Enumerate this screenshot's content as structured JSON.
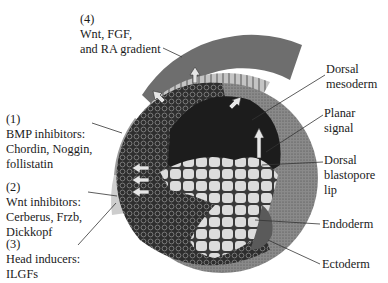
{
  "figure": {
    "left_labels": [
      {
        "id": "wnt_fgf_ra",
        "lines": [
          "(4)",
          "Wnt, FGF,",
          "and RA gradient"
        ]
      },
      {
        "id": "bmp_inhibitors",
        "lines": [
          "(1)",
          "BMP inhibitors:",
          "Chordin, Noggin,",
          "follistatin"
        ]
      },
      {
        "id": "wnt_inhibitors",
        "lines": [
          "(2)",
          "Wnt inhibitors:",
          "Cerberus, Frzb,",
          "Dickkopf"
        ]
      },
      {
        "id": "head_inducers",
        "lines": [
          "(3)",
          "Head inducers:",
          "ILGFs"
        ]
      }
    ],
    "right_labels": [
      {
        "id": "dorsal_mesoderm",
        "lines": [
          "Dorsal",
          "mesoderm"
        ]
      },
      {
        "id": "planar_signal",
        "lines": [
          "Planar",
          "signal"
        ]
      },
      {
        "id": "dorsal_blastopore_lip",
        "lines": [
          "Dorsal",
          "blastopore",
          "lip"
        ]
      },
      {
        "id": "endoderm",
        "lines": [
          "Endoderm"
        ]
      },
      {
        "id": "ectoderm",
        "lines": [
          "Ectoderm"
        ]
      }
    ],
    "colors": {
      "gradient_band": "#6e6e6e",
      "striped_band": "#b8b8b8",
      "bmp_band": "#9a9a9a",
      "wnt_band": "#c8c8c8",
      "embryo_outer": "#3a3a3a",
      "blastocoel": "#1c1c1c",
      "endoderm_cells": "#d8d8d8",
      "ectoderm_stipple": "#7a7a7a",
      "leader_line": "#333333"
    }
  }
}
